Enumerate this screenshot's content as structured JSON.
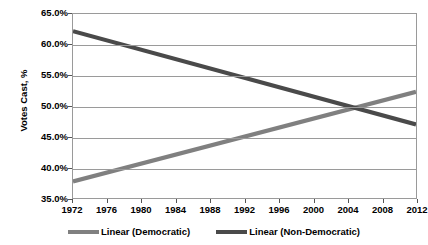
{
  "chart_data": {
    "type": "line",
    "title": "",
    "xlabel": "",
    "ylabel": "Votes Cast, %",
    "x": [
      1972,
      1976,
      1980,
      1984,
      1988,
      1992,
      1996,
      2000,
      2004,
      2008,
      2012
    ],
    "xlim": [
      1972,
      2012
    ],
    "ylim": [
      0.35,
      0.65
    ],
    "ytick_labels": [
      "65.0%",
      "60.0%",
      "55.0%",
      "50.0%",
      "45.0%",
      "40.0%",
      "35.0%"
    ],
    "ytick_values": [
      0.65,
      0.6,
      0.55,
      0.5,
      0.45,
      0.4,
      0.35
    ],
    "xtick_labels": [
      "1972",
      "1976",
      "1980",
      "1984",
      "1988",
      "1992",
      "1996",
      "2000",
      "2004",
      "2008",
      "2012"
    ],
    "grid": true,
    "legend_position": "bottom",
    "series": [
      {
        "name": "Linear (Democratic)",
        "color": "#808080",
        "endpoints": {
          "x0": 1972,
          "y0": 0.377,
          "x1": 2012,
          "y1": 0.523
        },
        "values": [
          0.377,
          0.392,
          0.406,
          0.421,
          0.435,
          0.45,
          0.465,
          0.479,
          0.494,
          0.508,
          0.523
        ]
      },
      {
        "name": "Linear (Non-Democratic)",
        "color": "#4a4a4a",
        "endpoints": {
          "x0": 1972,
          "y0": 0.622,
          "x1": 2012,
          "y1": 0.47
        },
        "values": [
          0.622,
          0.607,
          0.592,
          0.576,
          0.561,
          0.546,
          0.531,
          0.516,
          0.5,
          0.485,
          0.47
        ]
      }
    ],
    "annotations": [
      {
        "text": "crossover",
        "x": 2005,
        "y": 0.5
      }
    ]
  },
  "axes": {
    "y_title": "Votes Cast, %"
  },
  "legend": {
    "items": [
      {
        "label": "Linear (Democratic)",
        "color": "#808080"
      },
      {
        "label": "Linear (Non-Democratic)",
        "color": "#4a4a4a"
      }
    ]
  },
  "title_sliver": ""
}
